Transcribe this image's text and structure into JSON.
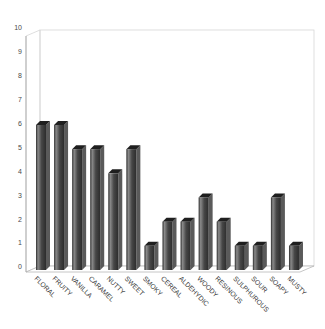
{
  "chart_data": {
    "type": "bar",
    "style": "3d-column",
    "title": "",
    "xlabel": "",
    "ylabel": "",
    "categories": [
      "FLORAL",
      "FRUITY",
      "VANILLA",
      "CARAMEL",
      "NUTTY",
      "SWEET",
      "SMOKY",
      "CEREAL",
      "ALDEHYDIC",
      "WOODY",
      "RESINOUS",
      "SULPHUROUS",
      "SOUR",
      "SOAPY",
      "MUSTY"
    ],
    "values": [
      6,
      6,
      5,
      5,
      4,
      5,
      1,
      2,
      2,
      3,
      2,
      1,
      1,
      3,
      1
    ],
    "ylim": [
      0,
      10
    ],
    "yticks": [
      "0",
      "1",
      "2",
      "3",
      "4",
      "5",
      "6",
      "7",
      "8",
      "9",
      "10"
    ],
    "grid": false,
    "legend": false,
    "colors": {
      "background": "#ffffff",
      "wall_border": "#d6d6d6",
      "axis_line": "#a8a8a8",
      "floor_line": "#b8b8b8",
      "bar_edge_dark": "#2c2c2c",
      "bar_highlight": "#8a8a8a",
      "bar_mid": "#474747",
      "bar_side": "#5a5a5a",
      "bar_top": "#1f1f1f",
      "tick_text": "#4a4a4a",
      "label_text": "#383838"
    }
  }
}
